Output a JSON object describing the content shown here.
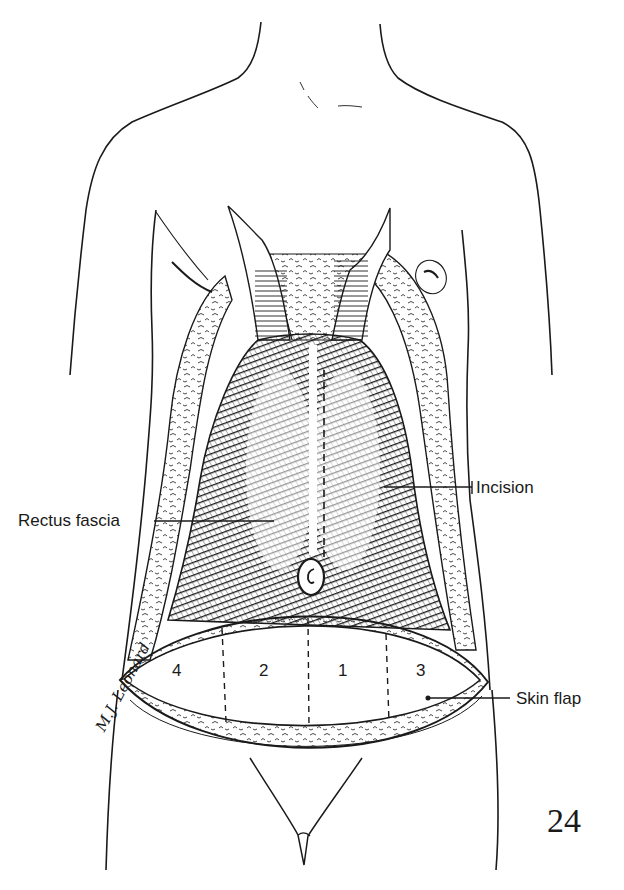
{
  "figure": {
    "number": "24",
    "type": "surgical line illustration",
    "colors": {
      "ink": "#1a1a1a",
      "paper": "#ffffff",
      "fascia_shade": "#2b2b2b"
    }
  },
  "labels": {
    "rectus_fascia": "Rectus fascia",
    "incision": "Incision",
    "skin_flap": "Skin flap"
  },
  "zones": [
    {
      "id": "zone-4",
      "text": "4"
    },
    {
      "id": "zone-2",
      "text": "2"
    },
    {
      "id": "zone-1",
      "text": "1"
    },
    {
      "id": "zone-3",
      "text": "3"
    }
  ],
  "signature": "M.J. Leonard"
}
